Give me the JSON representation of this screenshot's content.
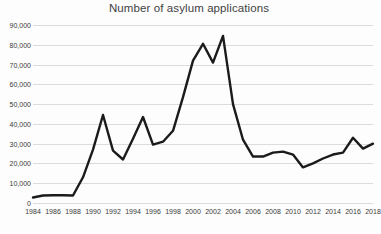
{
  "chart_data": {
    "type": "line",
    "title": "Number of asylum applications",
    "xlabel": "",
    "ylabel": "",
    "ylim": [
      0,
      90000
    ],
    "xlim": [
      1984,
      2018
    ],
    "grid": true,
    "legend": "none",
    "y_ticks": [
      0,
      10000,
      20000,
      30000,
      40000,
      50000,
      60000,
      70000,
      80000,
      90000
    ],
    "y_tick_labels": [
      "0",
      "10,000",
      "20,000",
      "30,000",
      "40,000",
      "50,000",
      "60,000",
      "70,000",
      "80,000",
      "90,000"
    ],
    "x_ticks": [
      1984,
      1986,
      1988,
      1990,
      1992,
      1994,
      1996,
      1998,
      2000,
      2002,
      2004,
      2006,
      2008,
      2010,
      2012,
      2014,
      2016,
      2018
    ],
    "x_tick_labels": [
      "1984",
      "1986",
      "1988",
      "1990",
      "1992",
      "1994",
      "1996",
      "1998",
      "2000",
      "2002",
      "2004",
      "2006",
      "2008",
      "2010",
      "2012",
      "2014",
      "2016",
      "2018"
    ],
    "series": [
      {
        "name": "Number of asylum applications",
        "color": "#1b1b1b",
        "x": [
          1984,
          1985,
          1986,
          1987,
          1988,
          1989,
          1990,
          1991,
          1992,
          1993,
          1994,
          1995,
          1996,
          1997,
          1998,
          1999,
          2000,
          2001,
          2002,
          2003,
          2004,
          2005,
          2006,
          2007,
          2008,
          2009,
          2010,
          2011,
          2012,
          2013,
          2014,
          2015,
          2016,
          2017,
          2018
        ],
        "values": [
          2800,
          3800,
          3900,
          3900,
          3800,
          13000,
          27000,
          44500,
          26500,
          22000,
          32500,
          43500,
          29500,
          31000,
          36500,
          53500,
          72000,
          80500,
          71000,
          84500,
          50000,
          32000,
          23500,
          23500,
          25500,
          26000,
          24500,
          18000,
          20000,
          22500,
          24500,
          25500,
          33000,
          27500,
          30000
        ]
      }
    ]
  }
}
